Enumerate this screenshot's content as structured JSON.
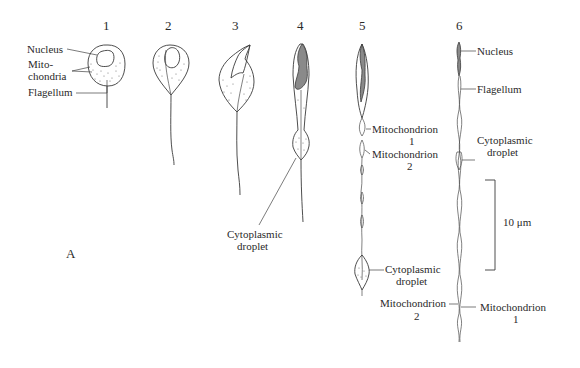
{
  "figure": {
    "panel_label": "A",
    "stages": [
      {
        "number": "1"
      },
      {
        "number": "2"
      },
      {
        "number": "3"
      },
      {
        "number": "4"
      },
      {
        "number": "5"
      },
      {
        "number": "6"
      }
    ],
    "labels": {
      "stage1_nucleus": "Nucleus",
      "stage1_mito_line1": "Mito-",
      "stage1_mito_line2": "chondria",
      "stage1_flagellum": "Flagellum",
      "stage4_droplet_line1": "Cytoplasmic",
      "stage4_droplet_line2": "droplet",
      "stage5_mito1_line1": "Mitochondrion",
      "stage5_mito1_line2": "1",
      "stage5_mito2_line1": "Mitochondrion",
      "stage5_mito2_line2": "2",
      "stage5_droplet_line1": "Cytoplasmic",
      "stage5_droplet_line2": "droplet",
      "stage5_bottom_mito_line1": "Mitochondrion",
      "stage5_bottom_mito_line2": "2",
      "stage6_nucleus": "Nucleus",
      "stage6_flagellum": "Flagellum",
      "stage6_droplet_line1": "Cytoplasmic",
      "stage6_droplet_line2": "droplet",
      "stage6_mito_line1": "Mitochondrion",
      "stage6_mito_line2": "1"
    },
    "scale_bar": {
      "label": "10 μm"
    },
    "colors": {
      "ink": "#3a3a3a",
      "background": "#ffffff"
    }
  }
}
